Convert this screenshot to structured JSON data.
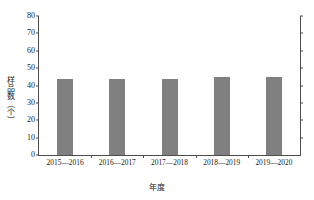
{
  "chart_data": {
    "type": "bar",
    "title": "",
    "xlabel": "年度",
    "ylabel": "样品数（个）",
    "categories": [
      "2015—2016",
      "2016—2017",
      "2017—2018",
      "2018—2019",
      "2019—2020"
    ],
    "values": [
      44,
      44,
      44,
      45,
      45
    ],
    "ylim": [
      0,
      80
    ],
    "ytick_labels": [
      "0",
      "10",
      "20",
      "30",
      "40",
      "50",
      "60",
      "70",
      "80"
    ],
    "ytick_values": [
      0,
      10,
      20,
      30,
      40,
      50,
      60,
      70,
      80
    ],
    "grid": false,
    "legend": null,
    "bar_color": "#808080",
    "axis_color": "#4d4d4d",
    "background": "#ffffff"
  }
}
